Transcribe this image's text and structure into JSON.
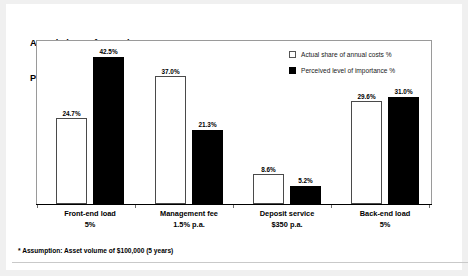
{
  "title_lines": [
    "Actual share of annual costs %",
    "Perceived level of importance %"
  ],
  "footnote": "* Assumption: Asset volume of $100,000 (5 years)",
  "legend": [
    {
      "label": "Actual share of annual costs %",
      "style": "open"
    },
    {
      "label": "Perceived level of importance %",
      "style": "solid"
    }
  ],
  "categories": [
    {
      "line1": "Front-end load",
      "line2": "5%"
    },
    {
      "line1": "Management fee",
      "line2": "1.5% p.a."
    },
    {
      "line1": "Deposit service",
      "line2": "$350 p.a."
    },
    {
      "line1": "Back-end load",
      "line2": "5%"
    }
  ],
  "labels": {
    "g0s0": "24.7%",
    "g0s1": "42.5%",
    "g1s0": "37.0%",
    "g1s1": "21.3%",
    "g2s0": "8.6%",
    "g2s1": "5.2%",
    "g3s0": "29.6%",
    "g3s1": "31.0%"
  },
  "colors": {
    "series_open_fill": "#ffffff",
    "series_open_border": "#4a4a4a",
    "series_solid_fill": "#000000",
    "page_background": "#f0f0f0",
    "card_background": "#ffffff",
    "frame_border": "#9a9a9a"
  },
  "chart_data": {
    "type": "bar",
    "xlabel": "",
    "ylabel": "",
    "ylim": [
      0,
      47
    ],
    "grid": false,
    "legend_position": "top-right",
    "categories": [
      "Front-end load 5%",
      "Management fee 1.5% p.a.",
      "Deposit service $350 p.a.",
      "Back-end load 5%"
    ],
    "series": [
      {
        "name": "Actual share of annual costs %",
        "values": [
          24.7,
          37.0,
          8.6,
          29.6
        ]
      },
      {
        "name": "Perceived level of importance %",
        "values": [
          42.5,
          21.3,
          5.2,
          31.0
        ]
      }
    ],
    "annotations": [
      "* Assumption: Asset volume of $100,000 (5 years)"
    ]
  }
}
